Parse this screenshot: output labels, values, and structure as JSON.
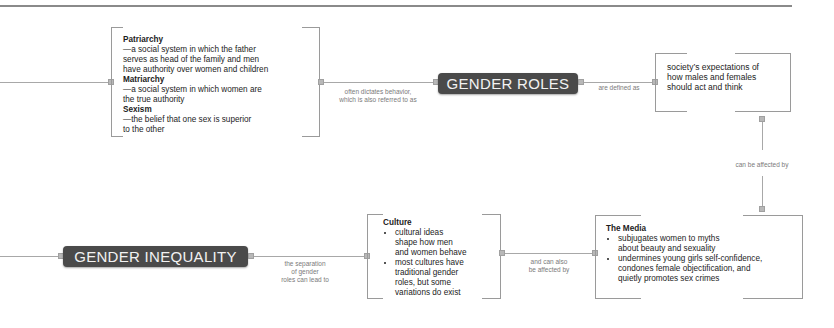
{
  "diagram": {
    "central_concepts": {
      "gender_roles": "GENDER ROLES",
      "gender_inequality": "GENDER INEQUALITY"
    },
    "definitions_box": {
      "items": [
        {
          "term": "Patriarchy",
          "definition": "—a social system in which the father serves as head of the family and men have authority over women and children",
          "lines": [
            "—a social system in which the father",
            "serves as head of the family and men",
            "have authority over women and children"
          ]
        },
        {
          "term": "Matriarchy",
          "definition": "—a social system in which women are the true authority",
          "lines": [
            "—a social system in which women are",
            "the true authority"
          ]
        },
        {
          "term": "Sexism",
          "definition": "—the belief that one sex is superior to the other",
          "lines": [
            "—the belief that one sex is superior",
            "to the other"
          ]
        }
      ]
    },
    "expectations_box": {
      "lines": [
        "society’s expectations of",
        "how males and females",
        "should act and think"
      ]
    },
    "culture_box": {
      "title": "Culture",
      "bullets": [
        {
          "lines": [
            "cultural ideas",
            "shape how men",
            "and women behave"
          ]
        },
        {
          "lines": [
            "most cultures have",
            "traditional gender",
            "roles, but some",
            "variations do exist"
          ]
        }
      ]
    },
    "media_box": {
      "title": "The Media",
      "bullets": [
        {
          "lines": [
            "subjugates women to myths",
            "about beauty and sexuality"
          ]
        },
        {
          "lines": [
            "undermines young girls self-confidence,",
            "condones female objectification, and",
            "quietly promotes sex crimes"
          ]
        }
      ]
    },
    "connector_labels": {
      "dictates": [
        "often dictates behavior,",
        "which is also referred to as"
      ],
      "defined_as": "are defined as",
      "affected_by": "can be affected by",
      "also_affected": [
        "and can also",
        "be affected by"
      ],
      "separation": [
        "the separation",
        "of gender",
        "roles can lead to"
      ]
    }
  }
}
